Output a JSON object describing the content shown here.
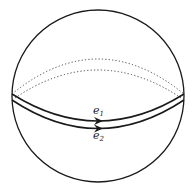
{
  "diagram": {
    "colors": {
      "stroke": "#1a1a1a",
      "background": "#ffffff"
    },
    "loops": [
      {
        "id": "e1",
        "label": "e",
        "subscript": "1",
        "style": "solid-front / dotted-back",
        "direction": "right"
      },
      {
        "id": "e2",
        "label": "e",
        "subscript": "2",
        "style": "solid-front / dotted-back",
        "direction": "right"
      }
    ]
  }
}
